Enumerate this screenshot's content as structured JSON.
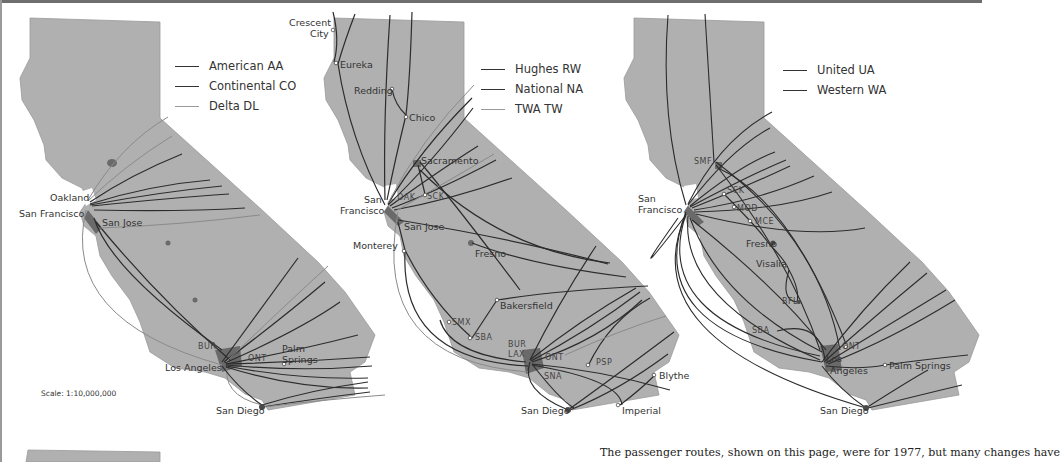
{
  "colors": {
    "land": "#b0b0b0",
    "metro": "#6a6a6a",
    "route_dark": "#2c2c2c",
    "route_light": "#8a8a8a",
    "text": "#333333"
  },
  "scale_label": "Scale: 1:10,000,000",
  "caption": "The passenger routes, shown on this page, were for 1977, but many changes have",
  "maps": [
    {
      "id": "map-1",
      "legend": [
        {
          "label": "American AA",
          "shade": "dark"
        },
        {
          "label": "Continental CO",
          "shade": "dark"
        },
        {
          "label": "Delta DL",
          "shade": "light"
        }
      ],
      "cities": [
        "Oakland",
        "San Francisco",
        "San Jose",
        "Los Angeles",
        "Palm",
        "Springs",
        "San Diego"
      ],
      "codes": [
        "BUR",
        "ONT"
      ]
    },
    {
      "id": "map-2",
      "legend": [
        {
          "label": "Hughes RW",
          "shade": "dark"
        },
        {
          "label": "National NA",
          "shade": "dark"
        },
        {
          "label": "TWA TW",
          "shade": "light"
        }
      ],
      "cities": [
        "Crescent",
        "City",
        "Eureka",
        "Redding",
        "Chico",
        "Sacramento",
        "San",
        "Francisco",
        "San Jose",
        "Monterey",
        "Fresno",
        "Bakersfield",
        "San Diego",
        "Imperial",
        "Blythe"
      ],
      "codes": [
        "OAK",
        "SCK",
        "SMX",
        "SBA",
        "BUR",
        "LAX",
        "ONT",
        "PSP",
        "SNA"
      ]
    },
    {
      "id": "map-3",
      "legend": [
        {
          "label": "United UA",
          "shade": "dark"
        },
        {
          "label": "Western WA",
          "shade": "dark"
        }
      ],
      "cities": [
        "San",
        "Francisco",
        "Fresno",
        "Visalia",
        "Los",
        "Angeles",
        "Palm Springs",
        "San Diego"
      ],
      "codes": [
        "SMF",
        "SCK",
        "MOD",
        "MCE",
        "BFL",
        "SBA",
        "ONT"
      ]
    }
  ]
}
